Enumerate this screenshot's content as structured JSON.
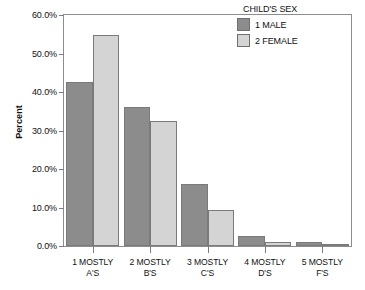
{
  "chart_data": {
    "type": "bar",
    "title": "",
    "xlabel": "",
    "ylabel": "Percent",
    "ylim": [
      0,
      60
    ],
    "grid": false,
    "legend_position": "top-right",
    "legend_title": "CHILD'S SEX",
    "categories": [
      "1 MOSTLY A'S",
      "2 MOSTLY B'S",
      "3 MOSTLY C'S",
      "4 MOSTLY D'S",
      "5 MOSTLY F'S"
    ],
    "category_lines": [
      [
        "1 MOSTLY",
        "A'S"
      ],
      [
        "2 MOSTLY",
        "B'S"
      ],
      [
        "3 MOSTLY",
        "C'S"
      ],
      [
        "4 MOSTLY",
        "D'S"
      ],
      [
        "5 MOSTLY",
        "F'S"
      ]
    ],
    "series": [
      {
        "name": "1 MALE",
        "color": "#8c8c8c",
        "values": [
          42.6,
          36.0,
          16.0,
          2.7,
          1.1
        ]
      },
      {
        "name": "2 FEMALE",
        "color": "#d4d4d4",
        "values": [
          54.7,
          32.6,
          9.4,
          1.1,
          0.4
        ]
      }
    ],
    "y_ticks": [
      0,
      10,
      20,
      30,
      40,
      50,
      60
    ],
    "y_tick_labels": [
      "0.0%",
      "10.0%",
      "20.0%",
      "30.0%",
      "40.0%",
      "50.0%",
      "60.0%"
    ]
  },
  "axes": {
    "y_title": "Percent"
  },
  "legend": {
    "title": "CHILD'S SEX",
    "entries": [
      {
        "label": "1 MALE",
        "swatch": "male"
      },
      {
        "label": "2 FEMALE",
        "swatch": "female"
      }
    ]
  },
  "colors": {
    "male": "#8c8c8c",
    "female": "#d4d4d4",
    "frame": "#8d8d8d",
    "text": "#111111",
    "background": "#ffffff"
  }
}
